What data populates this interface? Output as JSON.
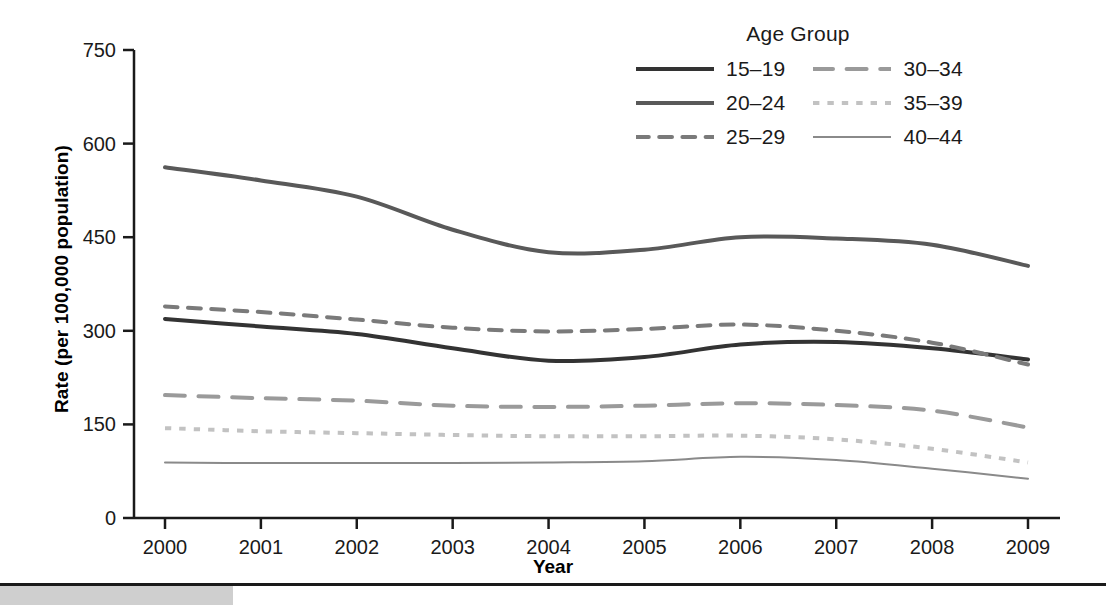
{
  "chart_data": {
    "type": "line",
    "title": "",
    "xlabel": "Year",
    "ylabel": "Rate (per 100,000 population)",
    "legend_title": "Age Group",
    "legend_position": "top-right",
    "grid": false,
    "x": [
      2000,
      2001,
      2002,
      2003,
      2004,
      2005,
      2006,
      2007,
      2008,
      2009
    ],
    "xticklabels": [
      "2000",
      "2001",
      "2002",
      "2003",
      "2004",
      "2005",
      "2006",
      "2007",
      "2008",
      "2009"
    ],
    "yticks": [
      0,
      150,
      300,
      450,
      600,
      750
    ],
    "yticklabels": [
      "0",
      "150",
      "300",
      "450",
      "600",
      "750"
    ],
    "ylim": [
      0,
      750
    ],
    "xlim": [
      2000,
      2009
    ],
    "series": [
      {
        "name": "15-19",
        "label": "15–19",
        "style": "solid",
        "color": "#333333",
        "width": 4,
        "values": [
          319,
          307,
          295,
          272,
          252,
          258,
          278,
          282,
          272,
          254
        ]
      },
      {
        "name": "20-24",
        "label": "20–24",
        "style": "solid",
        "color": "#595959",
        "width": 4,
        "values": [
          562,
          541,
          515,
          462,
          426,
          430,
          450,
          448,
          438,
          404
        ]
      },
      {
        "name": "25-29",
        "label": "25–29",
        "style": "dashed",
        "color": "#7a7a7a",
        "width": 4,
        "values": [
          339,
          330,
          318,
          305,
          299,
          303,
          310,
          300,
          281,
          246
        ]
      },
      {
        "name": "30-34",
        "label": "30–34",
        "style": "longdash",
        "color": "#9a9a9a",
        "width": 4,
        "values": [
          197,
          192,
          188,
          180,
          178,
          180,
          184,
          181,
          172,
          145
        ]
      },
      {
        "name": "35-39",
        "label": "35–39",
        "style": "dotted",
        "color": "#c2c2c2",
        "width": 4,
        "values": [
          144,
          139,
          136,
          133,
          131,
          131,
          132,
          126,
          111,
          89
        ]
      },
      {
        "name": "40-44",
        "label": "40–44",
        "style": "solid",
        "color": "#8a8a8a",
        "width": 2,
        "values": [
          89,
          88,
          88,
          88,
          89,
          91,
          98,
          93,
          79,
          63
        ]
      }
    ]
  },
  "footer": {
    "block_color": "#cfcfcf"
  }
}
